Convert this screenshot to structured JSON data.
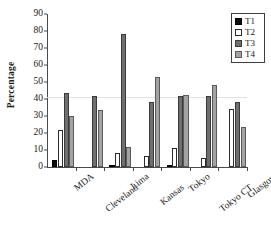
{
  "chart_data": {
    "type": "bar",
    "title": "",
    "xlabel": "",
    "ylabel": "Percentage",
    "ylim": [
      0,
      90
    ],
    "yticks": [
      0,
      10,
      20,
      30,
      40,
      50,
      60,
      70,
      80,
      90
    ],
    "grid": "horizontal-at-40",
    "legend_position": "top-right",
    "categories": [
      "MDA",
      "Cleveland",
      "Lima",
      "Kansas",
      "Tokyo",
      "Tokyo CT",
      "Glasgow"
    ],
    "series": [
      {
        "name": "T1",
        "color": "#0d0d0d",
        "values": [
          4,
          0,
          1,
          0,
          0.5,
          0,
          0
        ]
      },
      {
        "name": "T2",
        "color": "#ffffff",
        "values": [
          22,
          0,
          8,
          6.5,
          11,
          5.5,
          34
        ]
      },
      {
        "name": "T3",
        "color": "#6f6f6f",
        "values": [
          43.5,
          42,
          78,
          38,
          42,
          42,
          38
        ]
      },
      {
        "name": "T4",
        "color": "#a3a3a3",
        "values": [
          30,
          33.5,
          11.5,
          53,
          42.5,
          48.5,
          23.5
        ]
      }
    ]
  },
  "legend": {
    "items": [
      {
        "label": "T1",
        "key": "t1"
      },
      {
        "label": "T2",
        "key": "t2"
      },
      {
        "label": "T3",
        "key": "t3"
      },
      {
        "label": "T4",
        "key": "t4"
      }
    ]
  }
}
